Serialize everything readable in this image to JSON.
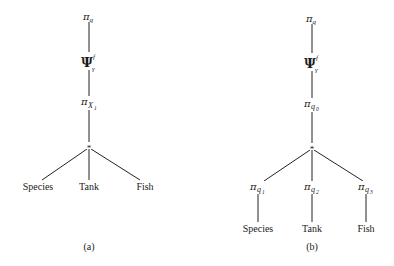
{
  "figure": {
    "trees": [
      {
        "caption": "(a)",
        "root": {
          "symbol": "π",
          "subscript": "q"
        },
        "grouping": {
          "symbol": "Ψ",
          "subscript": "γ",
          "superscript": "f"
        },
        "projection": {
          "symbol": "π",
          "subscript": "X",
          "subsub": "1"
        },
        "join": "*",
        "leaves": [
          "Species",
          "Tank",
          "Fish"
        ]
      },
      {
        "caption": "(b)",
        "root": {
          "symbol": "π",
          "subscript": "q"
        },
        "grouping": {
          "symbol": "Ψ",
          "subscript": "γ",
          "superscript": "f"
        },
        "projection": {
          "symbol": "π",
          "subscript": "q",
          "subsub": "0"
        },
        "join": "*",
        "child_projections": [
          {
            "symbol": "π",
            "subscript": "q",
            "subsub": "1"
          },
          {
            "symbol": "π",
            "subscript": "q",
            "subsub": "2"
          },
          {
            "symbol": "π",
            "subscript": "q",
            "subsub": "3"
          }
        ],
        "leaves": [
          "Species",
          "Tank",
          "Fish"
        ]
      }
    ]
  }
}
